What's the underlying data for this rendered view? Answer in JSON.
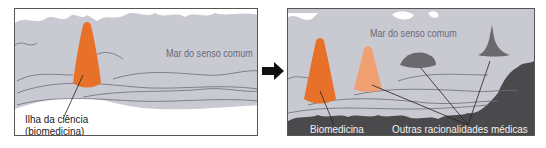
{
  "colors": {
    "sea": "#c9c9d1",
    "sea_lines": "#6c6c78",
    "biomedicine": "#e8712a",
    "other_light": "#f0a070",
    "other_dark": "#6a6a6e",
    "land": "#4a4a4c",
    "arrow": "#111111"
  },
  "left_panel": {
    "sea_label": "Mar do senso comum",
    "island_caption_line1": "Ilha da ciência",
    "island_caption_line2": "(biomedicina)"
  },
  "arrow": {
    "icon": "right-arrow-icon"
  },
  "right_panel": {
    "sea_label": "Mar do senso comum",
    "biomedicine_label": "Biomedicina",
    "others_label": "Outras racionalidades médicas"
  }
}
